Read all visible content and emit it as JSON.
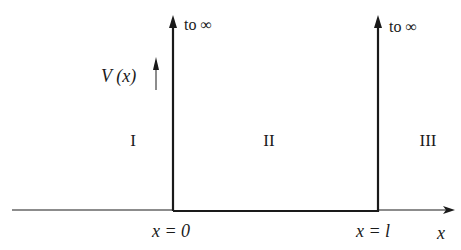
{
  "diagram": {
    "type": "infinite-square-well-potential",
    "y_axis_label": "V (x)",
    "x_axis_label": "x",
    "walls": [
      {
        "position_label": "x = 0",
        "top_label": "to ∞"
      },
      {
        "position_label": "x = l",
        "top_label": "to ∞"
      }
    ],
    "regions": [
      {
        "label": "I"
      },
      {
        "label": "II"
      },
      {
        "label": "III"
      }
    ],
    "colors": {
      "line": "#1a1a1a",
      "background": "#ffffff"
    }
  }
}
